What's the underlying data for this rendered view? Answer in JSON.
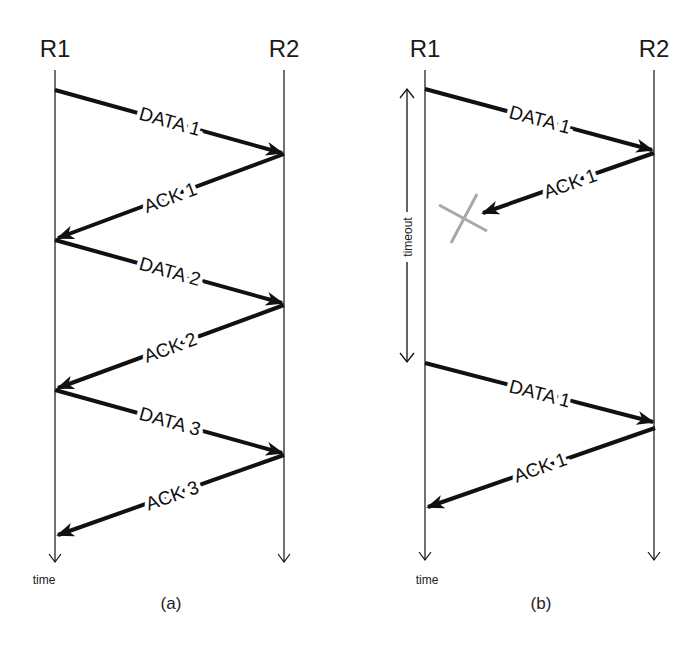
{
  "diagram": {
    "type": "sequence",
    "colors": {
      "line": "#111111",
      "lost_mark": "#a8a8a8",
      "background": "#ffffff"
    },
    "panels": [
      {
        "caption": "(a)",
        "time_label": "time",
        "nodes": [
          "R1",
          "R2"
        ],
        "messages": [
          {
            "label": "DATA 1",
            "from": "R1",
            "to": "R2"
          },
          {
            "label": "ACK 1",
            "from": "R2",
            "to": "R1"
          },
          {
            "label": "DATA 2",
            "from": "R1",
            "to": "R2"
          },
          {
            "label": "ACK 2",
            "from": "R2",
            "to": "R1"
          },
          {
            "label": "DATA 3",
            "from": "R1",
            "to": "R2"
          },
          {
            "label": "ACK 3",
            "from": "R2",
            "to": "R1"
          }
        ]
      },
      {
        "caption": "(b)",
        "time_label": "time",
        "timeout_label": "timeout",
        "nodes": [
          "R1",
          "R2"
        ],
        "messages": [
          {
            "label": "DATA 1",
            "from": "R1",
            "to": "R2"
          },
          {
            "label": "ACK 1",
            "from": "R2",
            "to": "R1",
            "lost": true
          },
          {
            "label": "DATA 1",
            "from": "R1",
            "to": "R2"
          },
          {
            "label": "ACK 1",
            "from": "R2",
            "to": "R1"
          }
        ]
      }
    ]
  }
}
